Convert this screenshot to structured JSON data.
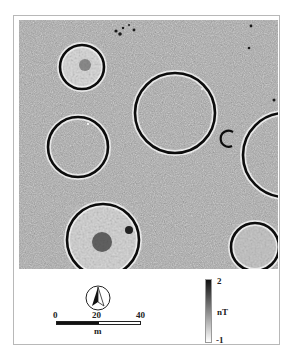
{
  "figure": {
    "type": "magnetometry map",
    "features": [
      {
        "name": "enclosure-top-left",
        "cx": 63,
        "cy": 47,
        "r": 22,
        "texture": "noisy"
      },
      {
        "name": "enclosure-large-center",
        "cx": 156,
        "cy": 93,
        "r": 40,
        "texture": "plain"
      },
      {
        "name": "enclosure-left-middle",
        "cx": 59,
        "cy": 127,
        "r": 30,
        "texture": "plain"
      },
      {
        "name": "small-arc",
        "cx": 209,
        "cy": 118,
        "r": 8,
        "texture": "arc"
      },
      {
        "name": "enclosure-right-partial",
        "cx": 266,
        "cy": 135,
        "r": 42,
        "texture": "plain"
      },
      {
        "name": "enclosure-bottom-left",
        "cx": 84,
        "cy": 220,
        "r": 36,
        "texture": "noisy"
      },
      {
        "name": "enclosure-bottom-right",
        "cx": 236,
        "cy": 227,
        "r": 24,
        "texture": "noisy"
      }
    ]
  },
  "scale_bar": {
    "labels": [
      "0",
      "20",
      "40"
    ],
    "unit": "m"
  },
  "north_arrow": {
    "icon": "north-arrow-icon"
  },
  "color_scale": {
    "max_label": "2",
    "unit": "nT",
    "min_label": "-1",
    "colors": {
      "max": "#111111",
      "min": "#ffffff"
    }
  }
}
